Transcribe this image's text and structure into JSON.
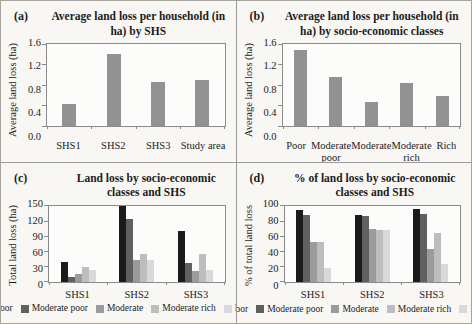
{
  "panels": [
    {
      "tag": "(a)"
    },
    {
      "tag": "(b)"
    },
    {
      "tag": "(c)"
    },
    {
      "tag": "(d)"
    }
  ],
  "colors": {
    "single_bar": "#929292",
    "axis_line": "#8a8a8a",
    "paper_background": "#f8f7f4",
    "text": "#1c1c1c"
  },
  "chart_data": [
    {
      "type": "bar",
      "title": "Average land loss per household (in ha) by SHS",
      "ylabel": "Average land loss (ha)",
      "xlabel": "",
      "categories": [
        "SHS1",
        "SHS2",
        "SHS3",
        "Study area"
      ],
      "values": [
        0.44,
        1.41,
        0.86,
        0.9
      ],
      "bar_color": "#929292",
      "ylim": [
        0,
        1.6
      ],
      "yticks": [
        0.0,
        0.4,
        0.8,
        1.2,
        1.6
      ],
      "ytick_decimals": 1,
      "grid": false,
      "legend_position": "none"
    },
    {
      "type": "bar",
      "title": "Average land loss per household (in ha) by socio-economic classes",
      "ylabel": "Average land loss (ha)",
      "xlabel": "",
      "categories": [
        "Poor",
        "Moderate poor",
        "Moderate",
        "Moderate rich",
        "Rich"
      ],
      "values": [
        1.5,
        0.97,
        0.48,
        0.85,
        0.6
      ],
      "bar_color": "#929292",
      "ylim": [
        0,
        1.6
      ],
      "yticks": [
        0.0,
        0.4,
        0.8,
        1.2,
        1.6
      ],
      "ytick_decimals": 1,
      "grid": false,
      "legend_position": "none"
    },
    {
      "type": "bar",
      "title": "Land loss by socio-economic classes and SHS",
      "ylabel": "Total land loss (ha)",
      "xlabel": "",
      "categories": [
        "SHS1",
        "SHS2",
        "SHS3"
      ],
      "series": [
        {
          "name": "Poor",
          "color": "#1b1b1b",
          "values": [
            40,
            149,
            100
          ]
        },
        {
          "name": "Moderate poor",
          "color": "#606060",
          "values": [
            10,
            125,
            37
          ]
        },
        {
          "name": "Moderate",
          "color": "#9b9b9b",
          "values": [
            16,
            44,
            21
          ]
        },
        {
          "name": "Moderate rich",
          "color": "#bdbdbd",
          "values": [
            30,
            55,
            55
          ]
        },
        {
          "name": "Rich",
          "color": "#d9d9d9",
          "values": [
            24,
            44,
            24
          ]
        }
      ],
      "ylim": [
        0,
        150
      ],
      "yticks": [
        0,
        30,
        60,
        90,
        120,
        150
      ],
      "ytick_decimals": 0,
      "grid": false,
      "legend_position": "bottom"
    },
    {
      "type": "bar",
      "title": "% of land loss by socio-economic classes and SHS",
      "ylabel": "% of total land loss",
      "xlabel": "",
      "categories": [
        "SHS1",
        "SHS2",
        "SHS3"
      ],
      "series": [
        {
          "name": "Poor",
          "color": "#1b1b1b",
          "values": [
            95,
            88,
            96
          ]
        },
        {
          "name": "Moderate poor",
          "color": "#606060",
          "values": [
            88,
            87,
            90
          ]
        },
        {
          "name": "Moderate",
          "color": "#9b9b9b",
          "values": [
            53,
            70,
            44
          ]
        },
        {
          "name": "Moderate rich",
          "color": "#bdbdbd",
          "values": [
            52,
            69,
            65
          ]
        },
        {
          "name": "Rich",
          "color": "#d9d9d9",
          "values": [
            19,
            68,
            23
          ]
        }
      ],
      "ylim": [
        0,
        100
      ],
      "yticks": [
        0,
        20,
        40,
        60,
        80,
        100
      ],
      "ytick_decimals": 0,
      "grid": false,
      "legend_position": "bottom"
    }
  ]
}
